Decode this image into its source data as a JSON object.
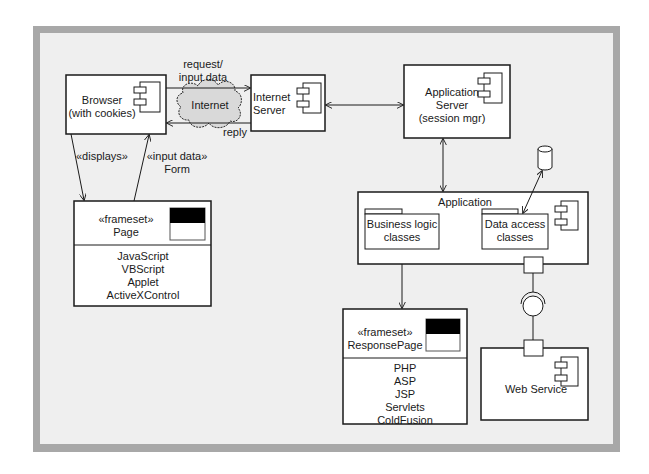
{
  "diagram": {
    "type": "UML component/deployment diagram",
    "nodes": {
      "browser": {
        "line1": "Browser",
        "line2": "(with cookies)"
      },
      "internet": {
        "label": "Internet"
      },
      "internet_server": {
        "line1": "Internet",
        "line2": "Server"
      },
      "app_server": {
        "line1": "Application",
        "line2": "Server",
        "line3": "(session mgr)"
      },
      "page": {
        "stereotype": "«frameset»",
        "name": "Page",
        "items": [
          "JavaScript",
          "VBScript",
          "Applet",
          "ActiveXControl"
        ]
      },
      "application": {
        "title": "Application",
        "packages": [
          {
            "line1": "Business logic",
            "line2": "classes"
          },
          {
            "line1": "Data access",
            "line2": "classes"
          }
        ]
      },
      "response_page": {
        "stereotype": "«frameset»",
        "name": "ResponsePage",
        "items": [
          "PHP",
          "ASP",
          "JSP",
          "Servlets",
          "ColdFusion"
        ]
      },
      "web_service": {
        "label": "Web Service"
      },
      "database": {
        "label": ""
      }
    },
    "edges": {
      "request": {
        "line1": "request/",
        "line2": "input data"
      },
      "reply": {
        "label": "reply"
      },
      "displays": {
        "label": "«displays»"
      },
      "input_form": {
        "line1": "«input data»",
        "line2": "Form"
      }
    },
    "colors": {
      "frame_border": "#a8a8a8",
      "canvas": "#efefef",
      "box_fill": "#ffffff",
      "cloud_fill": "#d9d9d9",
      "stroke": "#1a1a1a"
    }
  }
}
